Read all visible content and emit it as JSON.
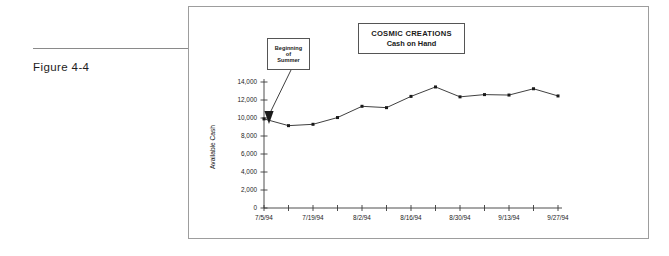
{
  "figure": {
    "label": "Figure 4-4"
  },
  "chart_title": {
    "main": "COSMIC CREATIONS",
    "sub": "Cash on Hand"
  },
  "annotation": {
    "lines": [
      "Beginning",
      "of",
      "Summer"
    ],
    "target_index": 1
  },
  "chart_data": {
    "type": "line",
    "title": "COSMIC CREATIONS Cash on Hand",
    "xlabel": "",
    "ylabel": "Available Cash",
    "x": [
      "7/5/94",
      "7/12/94",
      "7/19/94",
      "7/26/94",
      "8/2/94",
      "8/9/94",
      "8/16/94",
      "8/23/94",
      "8/30/94",
      "9/6/94",
      "9/13/94",
      "9/20/94",
      "9/27/94"
    ],
    "tick_labels": [
      "7/5/94",
      "",
      "7/19/94",
      "",
      "8/2/94",
      "",
      "8/16/94",
      "",
      "8/30/94",
      "",
      "9/13/94",
      "",
      "9/27/94"
    ],
    "values": [
      9900,
      9150,
      9300,
      10050,
      11300,
      11150,
      12400,
      13450,
      12350,
      12600,
      12550,
      13250,
      12450
    ],
    "ylim": [
      0,
      14000
    ],
    "ytick_values": [
      0,
      2000,
      4000,
      6000,
      8000,
      10000,
      12000,
      14000
    ],
    "ytick_labels": [
      "0",
      "2,000",
      "4,000",
      "6,000",
      "8,000",
      "10,000",
      "12,000",
      "14,000"
    ],
    "grid": false,
    "legend": "none",
    "marker": "square",
    "line_color": "#2a2a2a"
  }
}
